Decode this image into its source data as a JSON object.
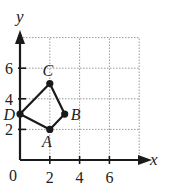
{
  "diagram": {
    "axes": {
      "x_label": "x",
      "y_label": "y",
      "origin_label": "0",
      "x_ticks": [
        {
          "value": 2,
          "label": "2"
        },
        {
          "value": 4,
          "label": "4"
        },
        {
          "value": 6,
          "label": "6"
        }
      ],
      "y_ticks": [
        {
          "value": 2,
          "label": "2"
        },
        {
          "value": 4,
          "label": "4"
        },
        {
          "value": 6,
          "label": "6"
        }
      ],
      "grid": {
        "x_min": 0,
        "x_max": 8,
        "y_min": 0,
        "y_max": 8,
        "step": 2,
        "style": "dotted"
      }
    },
    "points": [
      {
        "name": "A",
        "x": 2,
        "y": 2
      },
      {
        "name": "B",
        "x": 3,
        "y": 3
      },
      {
        "name": "C",
        "x": 2,
        "y": 5
      },
      {
        "name": "D",
        "x": 0,
        "y": 3
      }
    ],
    "polygon": [
      "A",
      "B",
      "C",
      "D"
    ],
    "colors": {
      "line": "#1a1a1a",
      "grid": "#999999",
      "point": "#1a1a1a"
    }
  }
}
